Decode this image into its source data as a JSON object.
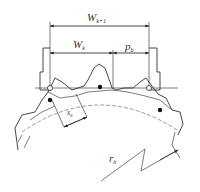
{
  "diagram": {
    "labels": {
      "w_k1": {
        "main": "W",
        "sub": "k+1"
      },
      "w_k": {
        "main": "W",
        "sub": "k"
      },
      "p_b": {
        "main": "p",
        "sub": "b"
      },
      "s_b": {
        "main": "s",
        "sub": "b"
      },
      "r_b": {
        "main": "r",
        "sub": "b"
      }
    },
    "colors": {
      "line": "#333333",
      "background": "#ffffff"
    }
  }
}
